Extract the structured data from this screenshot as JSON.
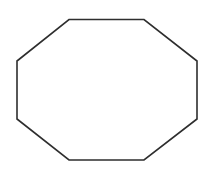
{
  "diagram": {
    "shape": "octagon",
    "background": "#ffffff",
    "stroke": "#2e2e2e",
    "stroke_width": 1.6,
    "fill": "none",
    "vertices": [
      [
        69,
        19.5
      ],
      [
        144,
        19.5
      ],
      [
        197,
        61
      ],
      [
        197,
        119
      ],
      [
        144,
        160
      ],
      [
        69,
        160
      ],
      [
        17,
        119
      ],
      [
        17,
        61
      ]
    ]
  }
}
